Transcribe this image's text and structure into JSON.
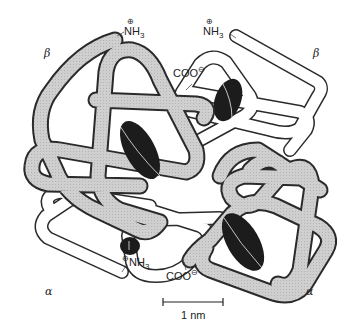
{
  "figure": {
    "colors": {
      "shaded_chain": "#c8c8c8",
      "open_chain": "#ffffff",
      "outline": "#2a2a2a",
      "heme": "#1c1c1c"
    },
    "subunit_labels": {
      "beta_top_left": "β",
      "beta_top_right": "β",
      "alpha_bottom_left": "α",
      "alpha_bottom_right": "α"
    },
    "terminus_labels": {
      "nh3_top_left": {
        "text": "NH",
        "sub": "3",
        "charge": "⊕"
      },
      "nh3_top_right": {
        "text": "NH",
        "sub": "3",
        "charge": "⊕"
      },
      "coo_upper_middle": {
        "text": "COO",
        "charge": "⊖"
      },
      "nh3_bottom_middle": {
        "text": "NH",
        "sub": "3",
        "charge": "⊕"
      },
      "coo_bottom_middle": {
        "text": "COO",
        "charge": "⊖"
      }
    },
    "scale_bar": {
      "label": "1 nm"
    },
    "heme_groups": [
      "heme-upper-left",
      "heme-upper-right",
      "heme-lower-middle",
      "heme-lower-right"
    ]
  }
}
